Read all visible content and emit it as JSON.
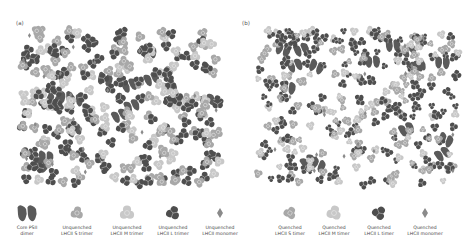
{
  "figure": {
    "panels": [
      {
        "id": "a",
        "label": "(a)",
        "state": "unquenched"
      },
      {
        "id": "b",
        "label": "(b)",
        "state": "quenched"
      }
    ],
    "colors": {
      "psii_core": "#5a5a5a",
      "lhcii_s": "#a8a8a8",
      "lhcii_m": "#c8c8c8",
      "lhcii_l": "#4e4e4e",
      "lhcii_monomer": "#8a8a8a",
      "background": "#ffffff"
    },
    "legend": [
      {
        "key": "core",
        "line1": "Core PSII",
        "line2": "dimer",
        "x": 22
      },
      {
        "key": "us",
        "line1": "Unquenched",
        "line2": "LHCII S trimer",
        "x": 70
      },
      {
        "key": "um",
        "line1": "Unquenched",
        "line2": "LHCII M trimer",
        "x": 120
      },
      {
        "key": "ul",
        "line1": "Unquenched",
        "line2": "LHCII L trimer",
        "x": 166
      },
      {
        "key": "umono",
        "line1": "Unquenched",
        "line2": "LHCII monomer",
        "x": 213
      },
      {
        "key": "qs",
        "line1": "Quenched",
        "line2": "LHCII S timer",
        "x": 283
      },
      {
        "key": "qm",
        "line1": "Quenched",
        "line2": "LHCII M timer",
        "x": 327
      },
      {
        "key": "ql",
        "line1": "Quenched",
        "line2": "LHCII L timer",
        "x": 372
      },
      {
        "key": "qmono",
        "line1": "Quenched",
        "line2": "LHCII monomer",
        "x": 418
      }
    ]
  }
}
